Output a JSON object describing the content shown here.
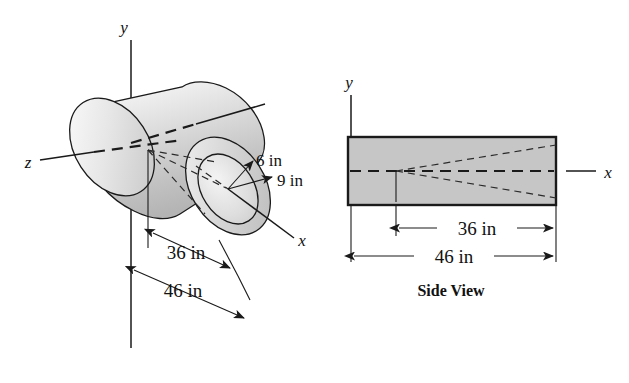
{
  "figure": {
    "caption": "Side View",
    "views": {
      "isometric": {
        "name": "isometric-cylinder-view",
        "axis_labels": {
          "x": "x",
          "y": "y",
          "z": "z"
        },
        "dimensions": [
          {
            "id": "inner-length",
            "label": "36 in",
            "value": 36,
            "unit": "in"
          },
          {
            "id": "outer-length",
            "label": "46 in",
            "value": 46,
            "unit": "in"
          },
          {
            "id": "inner-radius",
            "label": "6 in",
            "value": 6,
            "unit": "in"
          },
          {
            "id": "outer-radius",
            "label": "9 in",
            "value": 9,
            "unit": "in"
          }
        ]
      },
      "side": {
        "name": "side-view",
        "caption": "Side View",
        "axis_labels": {
          "x": "x",
          "y": "y"
        },
        "dimensions": [
          {
            "id": "inner-length",
            "label": "36 in",
            "value": 36,
            "unit": "in"
          },
          {
            "id": "outer-length",
            "label": "46 in",
            "value": 46,
            "unit": "in"
          }
        ]
      }
    },
    "colors": {
      "background": "#ffffff",
      "line": "#1a1a1a",
      "body_fill_light": "#f2f2f2",
      "body_fill_mid": "#d8d8d8",
      "body_fill_dark": "#bdbdbd",
      "side_view_fill": "#c8c8c8"
    }
  }
}
